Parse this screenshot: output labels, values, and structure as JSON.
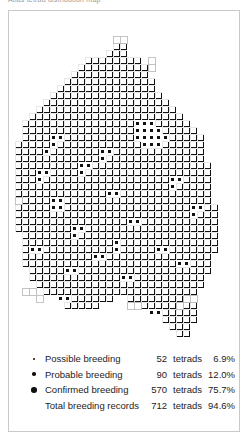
{
  "caption": {
    "text": "Atlas tetrad distribution map"
  },
  "legend": {
    "rows": [
      {
        "marker": "small",
        "label": "Possible breeding",
        "count": "52",
        "unit": "tetrads",
        "pct": "6.9%"
      },
      {
        "marker": "medium",
        "label": "Probable breeding",
        "count": "90",
        "unit": "tetrads",
        "pct": "12.0%"
      },
      {
        "marker": "large",
        "label": "Confirmed breeding",
        "count": "570",
        "unit": "tetrads",
        "pct": "75.7%"
      },
      {
        "marker": "none",
        "label": "Total breeding records",
        "count": "712",
        "unit": "tetrads",
        "pct": "94.6%"
      }
    ]
  },
  "map": {
    "colors": {
      "dot": "#111111",
      "cell": "#111111",
      "cell_outline": "#ffffff",
      "empty_outline": "#b4b4b4",
      "background": "#ffffff"
    },
    "grid": {
      "cell_px": 7.0,
      "origin_x": 6,
      "origin_y": 4,
      "cols": 31,
      "rows": 46
    },
    "marker_radius": {
      "small": 0.95,
      "medium": 1.8,
      "large": 2.8
    },
    "rows": [
      {
        "y": 3,
        "runs": [
          [
            14,
            2
          ]
        ],
        "sizes": "LL"
      },
      {
        "y": 4,
        "runs": [
          [
            14,
            2
          ]
        ],
        "sizes": "LL"
      },
      {
        "y": 5,
        "runs": [
          [
            13,
            3
          ]
        ],
        "sizes": "LLL"
      },
      {
        "y": 6,
        "runs": [
          [
            10,
            8
          ],
          [
            19,
            1
          ]
        ],
        "sizes": "LLLLLLLLM"
      },
      {
        "y": 7,
        "runs": [
          [
            9,
            10
          ],
          [
            19,
            1
          ]
        ],
        "sizes": "LLLLLLLLLLS"
      },
      {
        "y": 8,
        "runs": [
          [
            8,
            11
          ]
        ],
        "sizes": "LLLLLLLLLLL"
      },
      {
        "y": 9,
        "runs": [
          [
            7,
            13
          ]
        ],
        "sizes": "LLLLLLLLLLLLL"
      },
      {
        "y": 10,
        "runs": [
          [
            6,
            14
          ]
        ],
        "sizes": "LLLLLLLLLLLLLL"
      },
      {
        "y": 11,
        "runs": [
          [
            5,
            16
          ]
        ],
        "sizes": "LLLLLLLLLLLLLLLL"
      },
      {
        "y": 12,
        "runs": [
          [
            4,
            18
          ]
        ],
        "sizes": "LLLLLLLLLLLLLLLLLL"
      },
      {
        "y": 13,
        "runs": [
          [
            3,
            20
          ]
        ],
        "sizes": "LLLLLLLLLLLLLLLLLLLL"
      },
      {
        "y": 14,
        "runs": [
          [
            2,
            22
          ]
        ],
        "sizes": "LLLLLLLLLLLLLLLLLLLLLL"
      },
      {
        "y": 15,
        "runs": [
          [
            1,
            24
          ]
        ],
        "sizes": "LLLLLLLLLLLLLLLLLLLLLLLL"
      },
      {
        "y": 16,
        "runs": [
          [
            1,
            25
          ]
        ],
        "sizes": "LLLLLLLLLLLLLLLLLLLLLLLLL"
      },
      {
        "y": 17,
        "runs": [
          [
            1,
            26
          ]
        ],
        "sizes": "LLLLLLLLLLLLLLLLLLLLLLLLLL"
      },
      {
        "y": 18,
        "runs": [
          [
            0,
            27
          ]
        ],
        "sizes": "LLLLLLLLLLLLLLLLLLLLLLLLLLL"
      },
      {
        "y": 19,
        "runs": [
          [
            0,
            27
          ]
        ],
        "sizes": "LLLLLLLLLLLLLLLLLLLLLLLLLLL"
      },
      {
        "y": 20,
        "runs": [
          [
            0,
            27
          ]
        ],
        "sizes": "LLLLLLLLLLLLLLLLLLLLLLLLLLL"
      },
      {
        "y": 21,
        "runs": [
          [
            0,
            28
          ]
        ],
        "sizes": "LLLLLLLLLLLLLLLLLLLLLLLLLLLL"
      },
      {
        "y": 22,
        "runs": [
          [
            0,
            28
          ]
        ],
        "sizes": "LLLLLLLLLLLLLLLLLLLLLLLLLLLL"
      },
      {
        "y": 23,
        "runs": [
          [
            0,
            28
          ]
        ],
        "sizes": "LLLLLLLLLLLLLLLLLLLLLLLLLLLL"
      },
      {
        "y": 24,
        "runs": [
          [
            0,
            28
          ]
        ],
        "sizes": "LLLLLLLLLLLLLLLLLLLLLLLLLLLL"
      },
      {
        "y": 25,
        "runs": [
          [
            0,
            28
          ]
        ],
        "sizes": "LLLLLLLLLLLLLLLLLLLLLLLLLLLL"
      },
      {
        "y": 26,
        "runs": [
          [
            0,
            28
          ]
        ],
        "sizes": "LLLLLLLLLLLLLLLLLLLLLLLLLLLL"
      },
      {
        "y": 27,
        "runs": [
          [
            0,
            29
          ]
        ],
        "sizes": "LLLLLLLLLLLLLLLLLLLLLLLLLLLLL"
      },
      {
        "y": 28,
        "runs": [
          [
            0,
            29
          ]
        ],
        "sizes": "LLLLLLLLLLLLLLLLLLLLLLLLLLLLL"
      },
      {
        "y": 29,
        "runs": [
          [
            0,
            29
          ]
        ],
        "sizes": "LLLLLLLLLLLLLLLLLLLLLLLLLLLLL"
      },
      {
        "y": 30,
        "runs": [
          [
            0,
            29
          ]
        ],
        "sizes": "LLLLLLLLLLLLLLLLLLLLLLLLLLLLL"
      },
      {
        "y": 31,
        "runs": [
          [
            1,
            28
          ]
        ],
        "sizes": "LLLLLLLLLLLLLLLLLLLLLLLLLLLL"
      },
      {
        "y": 32,
        "runs": [
          [
            1,
            28
          ]
        ],
        "sizes": "LLLLLLLLLLLLLLLLLLLLLLLLLLLL"
      },
      {
        "y": 33,
        "runs": [
          [
            1,
            28
          ]
        ],
        "sizes": "LLLLLLLLLLLLLLLLLLLLLLLLLLLL"
      },
      {
        "y": 34,
        "runs": [
          [
            1,
            27
          ]
        ],
        "sizes": "LLLLLLLLLLLLLLLLLLLLLLLLLLL"
      },
      {
        "y": 35,
        "runs": [
          [
            1,
            27
          ]
        ],
        "sizes": "LLLLLLLLLLLLLLLLLLLLLLLLLLL"
      },
      {
        "y": 36,
        "runs": [
          [
            2,
            26
          ]
        ],
        "sizes": "LLLLLLLLLLLLLLLLLLLLLLLLLL"
      },
      {
        "y": 37,
        "runs": [
          [
            2,
            25
          ]
        ],
        "sizes": "LLLLLLLLLLLLLLLLLLLLLLLLL"
      },
      {
        "y": 38,
        "runs": [
          [
            3,
            24
          ]
        ],
        "sizes": "LLLLLLLLLLLLLLLLLLLLLLLL"
      },
      {
        "y": 39,
        "runs": [
          [
            4,
            22
          ]
        ],
        "sizes": "LLLLLLLLLLLLLLLLLLLLLL"
      },
      {
        "y": 40,
        "runs": [
          [
            6,
            8
          ],
          [
            16,
            10
          ]
        ],
        "sizes": "LLLLLLLLLLLLLLLLLL"
      },
      {
        "y": 41,
        "runs": [
          [
            7,
            5
          ],
          [
            17,
            9
          ]
        ],
        "sizes": "LLLLLLLLLLLLLL"
      },
      {
        "y": 42,
        "runs": [
          [
            19,
            7
          ]
        ],
        "sizes": "LLLLLLL"
      },
      {
        "y": 43,
        "runs": [
          [
            21,
            5
          ]
        ],
        "sizes": "LLLLL"
      },
      {
        "y": 44,
        "runs": [
          [
            22,
            3
          ]
        ],
        "sizes": "LLL"
      },
      {
        "y": 45,
        "runs": [
          [
            23,
            2
          ]
        ],
        "sizes": "LL"
      }
    ],
    "holes": [
      [
        5,
        17
      ],
      [
        6,
        17
      ],
      [
        5,
        18
      ],
      [
        12,
        19
      ],
      [
        13,
        19
      ],
      [
        12,
        20
      ],
      [
        17,
        15
      ],
      [
        18,
        15
      ],
      [
        19,
        15
      ],
      [
        17,
        16
      ],
      [
        18,
        16
      ],
      [
        19,
        16
      ],
      [
        20,
        16
      ],
      [
        17,
        17
      ],
      [
        18,
        17
      ],
      [
        19,
        17
      ],
      [
        20,
        17
      ],
      [
        21,
        17
      ],
      [
        18,
        18
      ],
      [
        19,
        18
      ],
      [
        20,
        18
      ],
      [
        3,
        22
      ],
      [
        4,
        22
      ],
      [
        3,
        23
      ],
      [
        9,
        21
      ],
      [
        10,
        21
      ],
      [
        9,
        22
      ],
      [
        5,
        26
      ],
      [
        6,
        26
      ],
      [
        5,
        27
      ],
      [
        6,
        27
      ],
      [
        13,
        25
      ],
      [
        14,
        25
      ],
      [
        8,
        30
      ],
      [
        9,
        30
      ],
      [
        8,
        31
      ],
      [
        16,
        29
      ],
      [
        17,
        29
      ],
      [
        2,
        33
      ],
      [
        3,
        33
      ],
      [
        11,
        34
      ],
      [
        12,
        34
      ],
      [
        20,
        33
      ],
      [
        21,
        33
      ],
      [
        7,
        36
      ],
      [
        8,
        36
      ],
      [
        15,
        37
      ],
      [
        16,
        37
      ],
      [
        23,
        35
      ],
      [
        24,
        35
      ],
      [
        4,
        19
      ],
      [
        22,
        23
      ],
      [
        23,
        23
      ],
      [
        22,
        24
      ],
      [
        25,
        27
      ],
      [
        26,
        27
      ],
      [
        25,
        28
      ],
      [
        14,
        32
      ],
      [
        14,
        33
      ],
      [
        6,
        40
      ],
      [
        7,
        40
      ],
      [
        19,
        42
      ],
      [
        20,
        42
      ]
    ],
    "outline_cells": [
      [
        0,
        26
      ],
      [
        14,
        3
      ],
      [
        15,
        3
      ],
      [
        19,
        6
      ],
      [
        19,
        7
      ],
      [
        1,
        39
      ],
      [
        2,
        39
      ],
      [
        3,
        40
      ],
      [
        24,
        40
      ],
      [
        25,
        40
      ],
      [
        23,
        41
      ],
      [
        16,
        41
      ],
      [
        17,
        41
      ]
    ]
  }
}
